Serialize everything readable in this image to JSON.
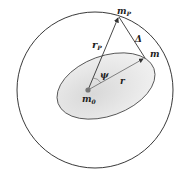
{
  "labels": {
    "mp": "m",
    "mp_sub": "P",
    "delta": "Δ",
    "rp": "r",
    "rp_sub": "P",
    "m": "m",
    "psi": "ψ",
    "r": "r",
    "m0": "m",
    "m0_sub": "0"
  },
  "colors": {
    "stroke": "#222222",
    "ellipse_fill": "#e6e6e6",
    "arrow": "#555555"
  }
}
